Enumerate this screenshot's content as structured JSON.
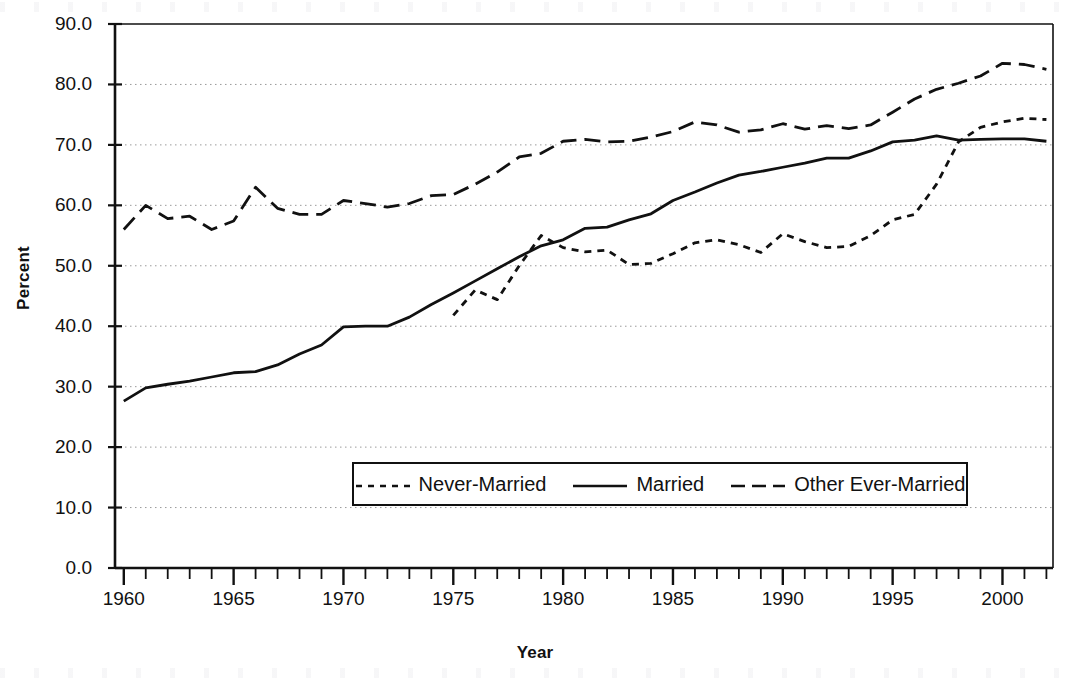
{
  "chart_data": {
    "type": "line",
    "title": "",
    "xlabel": "Year",
    "ylabel": "Percent",
    "xlim": [
      1959.6,
      2002.3
    ],
    "ylim": [
      0.0,
      90.0
    ],
    "grid": true,
    "grid_style": "dotted-horizontal",
    "legend_position": "inside-lower-center",
    "y_ticks": [
      "0.0",
      "10.0",
      "20.0",
      "30.0",
      "40.0",
      "50.0",
      "60.0",
      "70.0",
      "80.0",
      "90.0"
    ],
    "y_tick_values": [
      0.0,
      10.0,
      20.0,
      30.0,
      40.0,
      50.0,
      60.0,
      70.0,
      80.0,
      90.0
    ],
    "x_ticks": [
      "1960",
      "1965",
      "1970",
      "1975",
      "1980",
      "1985",
      "1990",
      "1995",
      "2000"
    ],
    "x_tick_values": [
      1960,
      1965,
      1970,
      1975,
      1980,
      1985,
      1990,
      1995,
      2000
    ],
    "x_minor_tick_interval": 1,
    "series": [
      {
        "name": "Never-Married",
        "line_style": "short-dash",
        "color": "#111111",
        "x": [
          1975,
          1976,
          1977,
          1978,
          1979,
          1980,
          1981,
          1982,
          1983,
          1984,
          1985,
          1986,
          1987,
          1988,
          1989,
          1990,
          1991,
          1992,
          1993,
          1994,
          1995,
          1996,
          1997,
          1998,
          1999,
          2000,
          2001,
          2002
        ],
        "values": [
          41.8,
          46.0,
          44.4,
          50.0,
          55.0,
          53.0,
          52.3,
          52.6,
          50.2,
          50.4,
          52.0,
          53.8,
          54.3,
          53.5,
          52.2,
          55.3,
          54.0,
          53.0,
          53.2,
          55.0,
          57.6,
          58.5,
          63.5,
          70.5,
          72.9,
          73.8,
          74.4,
          74.2
        ]
      },
      {
        "name": "Married",
        "line_style": "solid",
        "color": "#111111",
        "x": [
          1960,
          1961,
          1962,
          1963,
          1964,
          1965,
          1966,
          1967,
          1968,
          1969,
          1970,
          1971,
          1972,
          1973,
          1974,
          1975,
          1976,
          1977,
          1978,
          1979,
          1980,
          1981,
          1982,
          1983,
          1984,
          1985,
          1986,
          1987,
          1988,
          1989,
          1990,
          1991,
          1992,
          1993,
          1994,
          1995,
          1996,
          1997,
          1998,
          1999,
          2000,
          2001,
          2002
        ],
        "values": [
          27.6,
          29.8,
          30.4,
          30.9,
          31.6,
          32.3,
          32.5,
          33.6,
          35.4,
          36.9,
          39.9,
          40.0,
          40.0,
          41.5,
          43.6,
          45.5,
          47.5,
          49.5,
          51.5,
          53.3,
          54.3,
          56.2,
          56.4,
          57.6,
          58.6,
          60.8,
          62.2,
          63.7,
          65.0,
          65.6,
          66.3,
          67.0,
          67.8,
          67.8,
          69.0,
          70.5,
          70.8,
          71.5,
          70.8,
          70.9,
          71.0,
          71.0,
          70.6
        ]
      },
      {
        "name": "Other Ever-Married",
        "line_style": "long-dash",
        "color": "#111111",
        "x": [
          1960,
          1961,
          1962,
          1963,
          1964,
          1965,
          1966,
          1967,
          1968,
          1969,
          1970,
          1971,
          1972,
          1973,
          1974,
          1975,
          1976,
          1977,
          1978,
          1979,
          1980,
          1981,
          1982,
          1983,
          1984,
          1985,
          1986,
          1987,
          1988,
          1989,
          1990,
          1991,
          1992,
          1993,
          1994,
          1995,
          1996,
          1997,
          1998,
          1999,
          2000,
          2001,
          2002
        ],
        "values": [
          56.0,
          60.0,
          57.8,
          58.2,
          56.0,
          57.4,
          63.0,
          59.5,
          58.5,
          58.5,
          60.8,
          60.3,
          59.7,
          60.3,
          61.6,
          61.8,
          63.5,
          65.5,
          68.0,
          68.6,
          70.6,
          70.9,
          70.5,
          70.6,
          71.3,
          72.2,
          73.8,
          73.3,
          72.1,
          72.5,
          73.5,
          72.6,
          73.2,
          72.7,
          73.3,
          75.4,
          77.6,
          79.2,
          80.2,
          81.4,
          83.5,
          83.3,
          82.5
        ]
      }
    ]
  },
  "legend": {
    "entries": [
      {
        "label": "Never-Married",
        "style": "short-dash"
      },
      {
        "label": "Married",
        "style": "solid"
      },
      {
        "label": "Other Ever-Married",
        "style": "long-dash"
      }
    ]
  },
  "axis_titles": {
    "x": "Year",
    "y": "Percent"
  }
}
